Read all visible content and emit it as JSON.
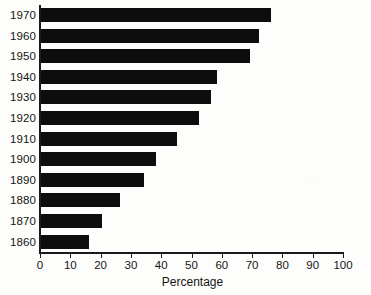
{
  "chart_data": {
    "type": "bar",
    "orientation": "horizontal",
    "title": "",
    "xlabel": "Percentage",
    "ylabel": "",
    "xlim": [
      0,
      100
    ],
    "xticks": [
      0,
      10,
      20,
      30,
      40,
      50,
      60,
      70,
      80,
      90,
      100
    ],
    "grid": false,
    "legend": null,
    "bar_color": "#0d0d0d",
    "background_color": "#fdfdfb",
    "axis_color": "#1a1a1a",
    "categories": [
      "1970",
      "1960",
      "1950",
      "1940",
      "1930",
      "1920",
      "1910",
      "1900",
      "1890",
      "1880",
      "1870",
      "1860"
    ],
    "values": [
      76,
      72,
      69,
      58,
      56,
      52,
      45,
      38,
      34,
      26,
      20,
      16
    ],
    "series": [
      {
        "name": "Percentage",
        "values": [
          76,
          72,
          69,
          58,
          56,
          52,
          45,
          38,
          34,
          26,
          20,
          16
        ]
      }
    ],
    "points": [
      {
        "category": "1970",
        "value": 76
      },
      {
        "category": "1960",
        "value": 72
      },
      {
        "category": "1950",
        "value": 69
      },
      {
        "category": "1940",
        "value": 58
      },
      {
        "category": "1930",
        "value": 56
      },
      {
        "category": "1920",
        "value": 52
      },
      {
        "category": "1910",
        "value": 45
      },
      {
        "category": "1900",
        "value": 38
      },
      {
        "category": "1890",
        "value": 34
      },
      {
        "category": "1880",
        "value": 26
      },
      {
        "category": "1870",
        "value": 20
      },
      {
        "category": "1860",
        "value": 16
      }
    ]
  }
}
